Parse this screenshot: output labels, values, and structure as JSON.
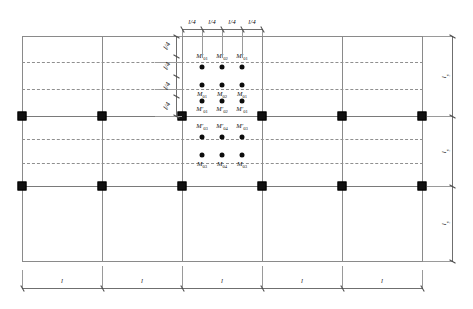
{
  "figure": {
    "grid": {
      "columns": 6,
      "rows": 4,
      "bays_x": 5,
      "spans_y": 3,
      "node_rows": [
        2,
        3
      ]
    },
    "colors": {
      "gridline": "#8a8a8a",
      "dashed": "#8f8f8f",
      "node": "#111111",
      "dot": "#0d0d0d",
      "dimension": "#6f6f6f",
      "text": "#1a1a1a"
    }
  },
  "dimensions": {
    "top": {
      "label_text": "l/4",
      "segments": [
        "l/4",
        "l/4",
        "l/4",
        "l/4"
      ]
    },
    "left": {
      "label_text": "l/4",
      "segments": [
        "l/4",
        "l/4",
        "l/4",
        "l/4"
      ]
    },
    "bottom": {
      "label_text": "l",
      "segments": [
        "l",
        "l",
        "l",
        "l",
        "l"
      ]
    },
    "right": {
      "label_base": "l",
      "label_sub": "y",
      "segments": [
        {
          "base": "l",
          "sub": "y"
        },
        {
          "base": "l",
          "sub": "y"
        },
        {
          "base": "l",
          "sub": "y"
        }
      ]
    }
  },
  "moment_labels": {
    "row1": [
      {
        "base": "M",
        "prime": "′",
        "sub": "01"
      },
      {
        "base": "M",
        "prime": "′",
        "sub": "02"
      },
      {
        "base": "M",
        "prime": "′",
        "sub": "01"
      }
    ],
    "row2": [
      {
        "base": "M",
        "prime": "",
        "sub": "01"
      },
      {
        "base": "M",
        "prime": "",
        "sub": "02"
      },
      {
        "base": "M",
        "prime": "",
        "sub": "01"
      }
    ],
    "row3": [
      {
        "base": "M",
        "prime": "′",
        "sub": "01"
      },
      {
        "base": "M",
        "prime": "′",
        "sub": "02"
      },
      {
        "base": "M",
        "prime": "′",
        "sub": "01"
      }
    ],
    "row4": [
      {
        "base": "M",
        "prime": "′",
        "sub": "03"
      },
      {
        "base": "M",
        "prime": "′",
        "sub": "04"
      },
      {
        "base": "M",
        "prime": "′",
        "sub": "03"
      }
    ],
    "row5": [
      {
        "base": "M",
        "prime": "",
        "sub": "03"
      },
      {
        "base": "M",
        "prime": "",
        "sub": "04"
      },
      {
        "base": "M",
        "prime": "",
        "sub": "03"
      }
    ]
  }
}
